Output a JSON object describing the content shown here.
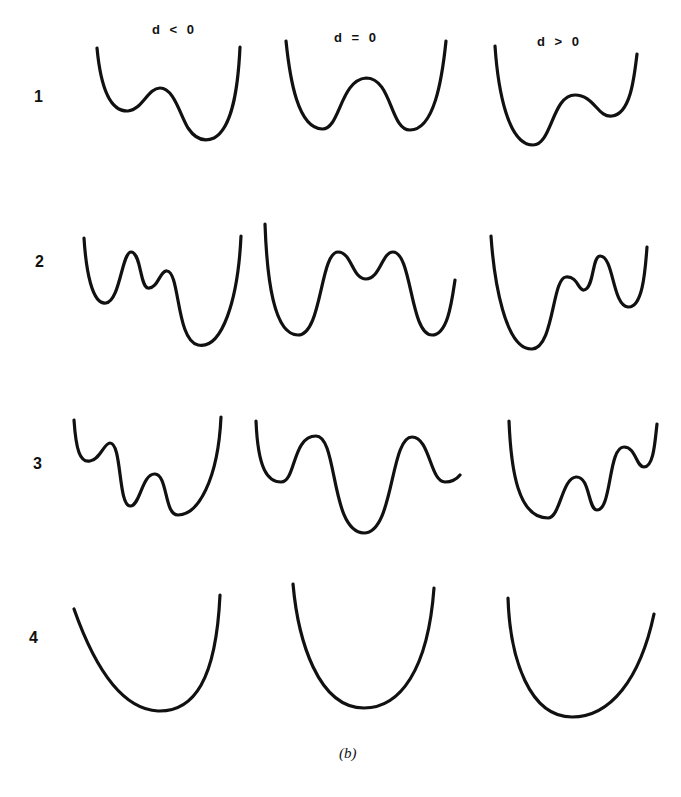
{
  "figure": {
    "columns": [
      {
        "label": "d < 0"
      },
      {
        "label": "d = 0"
      },
      {
        "label": "d > 0"
      }
    ],
    "rows": [
      {
        "label": "1"
      },
      {
        "label": "2"
      },
      {
        "label": "3"
      },
      {
        "label": "4"
      }
    ],
    "caption": "(b)",
    "stroke_color": "#111111",
    "background_color": "#ffffff"
  }
}
